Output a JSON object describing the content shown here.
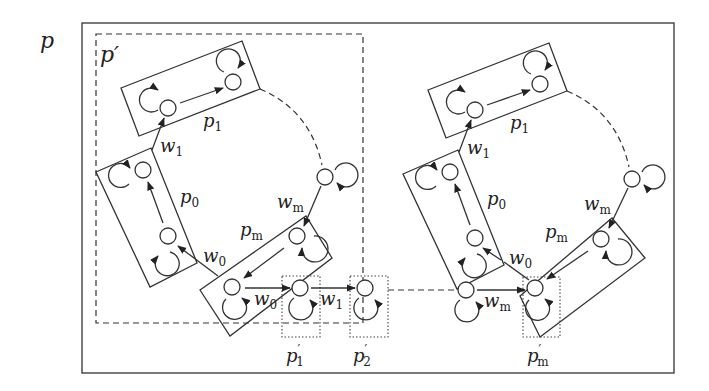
{
  "diagram": {
    "outer_label": {
      "base": "p",
      "prime": "",
      "sub": ""
    },
    "inner_label": {
      "base": "p",
      "prime": "′",
      "sub": ""
    },
    "left_cluster": {
      "p1": {
        "base": "p",
        "sub": "1"
      },
      "p0": {
        "base": "p",
        "sub": "0"
      },
      "pm": {
        "base": "p",
        "sub": "m"
      },
      "w1": {
        "base": "w",
        "sub": "1"
      },
      "w0": {
        "base": "w",
        "sub": "0"
      },
      "wm": {
        "base": "w",
        "sub": "m"
      },
      "w0_bottom": {
        "base": "w",
        "sub": "0"
      },
      "w1_bottom": {
        "base": "w",
        "sub": "1"
      },
      "p1_prime": {
        "base": "p",
        "prime": "′",
        "sub": "1"
      },
      "p2_prime": {
        "base": "p",
        "prime": "′",
        "sub": "2"
      }
    },
    "right_cluster": {
      "p1": {
        "base": "p",
        "sub": "1"
      },
      "p0": {
        "base": "p",
        "sub": "0"
      },
      "pm": {
        "base": "p",
        "sub": "m"
      },
      "w1": {
        "base": "w",
        "sub": "1"
      },
      "w0": {
        "base": "w",
        "sub": "0"
      },
      "wm": {
        "base": "w",
        "sub": "m"
      },
      "wm_bottom": {
        "base": "w",
        "sub": "m"
      },
      "pm_prime": {
        "base": "p",
        "prime": "′",
        "sub": "m"
      }
    }
  }
}
